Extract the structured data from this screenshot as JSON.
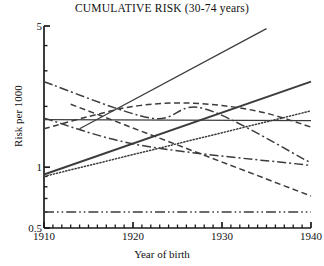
{
  "chart_data": {
    "type": "line",
    "title": "CUMULATIVE RISK (30-74 years)",
    "xlabel": "Year of birth",
    "ylabel": "Risk per 1000",
    "yscale": "log",
    "ylim": [
      0.5,
      5
    ],
    "xlim": [
      1910,
      1940
    ],
    "grid": false,
    "legend": "none",
    "ytick_labels": [
      "5",
      "1",
      "0.5"
    ],
    "ytick_values": [
      5,
      1,
      0.5
    ],
    "yminor_values": [
      4,
      3,
      2,
      0.9,
      0.8,
      0.7,
      0.6
    ],
    "xtick_labels": [
      "1910",
      "1920",
      "1930",
      "1940"
    ],
    "xtick_values": [
      1910,
      1920,
      1930,
      1940
    ],
    "xminor_step": 1,
    "series": [
      {
        "name": "series-1-steep-rise-solid",
        "style": "solid",
        "x": [
          1914,
          1935
        ],
        "values": [
          1.55,
          4.85
        ]
      },
      {
        "name": "series-2-rise-solid-thick",
        "style": "solid",
        "x": [
          1910,
          1940
        ],
        "values": [
          0.92,
          2.65
        ]
      },
      {
        "name": "series-3-rise-dotted",
        "style": "dotted",
        "x": [
          1910,
          1940
        ],
        "values": [
          0.9,
          1.9
        ]
      },
      {
        "name": "series-4-arch-dashed",
        "style": "dashed",
        "x": [
          1910,
          1915,
          1920,
          1925,
          1930,
          1935,
          1940
        ],
        "values": [
          1.55,
          1.78,
          2.0,
          2.08,
          2.02,
          1.85,
          1.58
        ]
      },
      {
        "name": "series-5-decline-dashdot",
        "style": "dashdot",
        "x": [
          1910,
          1922,
          1928,
          1940
        ],
        "values": [
          2.65,
          1.75,
          1.95,
          1.05
        ]
      },
      {
        "name": "series-6-v-shape-dashdot",
        "style": "dashdot",
        "x": [
          1910,
          1921,
          1940
        ],
        "values": [
          1.75,
          1.28,
          1.02
        ]
      },
      {
        "name": "series-7-flat-solid-thin",
        "style": "solid",
        "x": [
          1910,
          1940
        ],
        "values": [
          1.72,
          1.7
        ]
      },
      {
        "name": "series-8-decline-dashed",
        "style": "dashed",
        "x": [
          1913,
          1940
        ],
        "values": [
          2.05,
          0.72
        ]
      },
      {
        "name": "series-9-flat-dashdotdot",
        "style": "dashdotdot",
        "x": [
          1910,
          1940
        ],
        "values": [
          0.6,
          0.6
        ]
      }
    ],
    "colors": {
      "axis": "#1a1a1a",
      "line": "#3c3c3c",
      "background": "#ffffff"
    }
  }
}
